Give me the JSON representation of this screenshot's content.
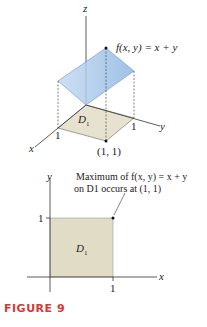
{
  "figure3d": {
    "z_label": "z",
    "x_label": "x",
    "y_label": "y",
    "func_label": "f(x, y) = x + y",
    "region_label": "D",
    "region_sub": "1",
    "tick_x": "1",
    "tick_y": "1",
    "point_label": "(1, 1)"
  },
  "figure2d": {
    "y_label": "y",
    "x_label": "x",
    "tick_y": "1",
    "tick_x": "1",
    "region_label": "D",
    "region_sub": "1",
    "annotation_line1": "Maximum of f(x, y) = x + y",
    "annotation_line2": "on D1 occurs at (1, 1)"
  },
  "caption": "FIGURE 9",
  "colors": {
    "plane": "#a9c8ea",
    "region": "#e6e2cf",
    "caption": "#d33a3a"
  }
}
